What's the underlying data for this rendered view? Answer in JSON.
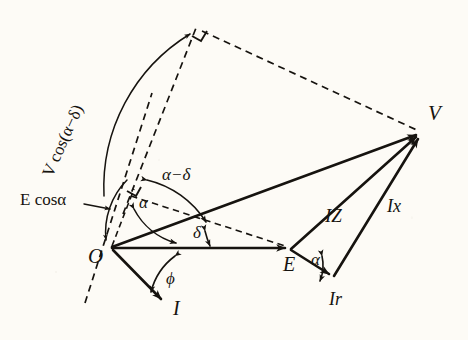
{
  "figure": {
    "kind": "phasor-diagram",
    "background_color": "#fdfbf6",
    "ink_color": "#16130f"
  },
  "labels": {
    "origin": "O",
    "voltage_v": "V",
    "emf_e": "E",
    "current_i": "I",
    "impedance_drop": "IZ",
    "reactive_drop": "Ix",
    "resistive_drop": "Ir",
    "angle_alpha_origin": "α",
    "angle_alpha_at_e": "α",
    "angle_delta": "δ",
    "angle_alpha_minus_delta": "α−δ",
    "angle_phi": "ϕ",
    "projection_e": "E cosα",
    "projection_v": "V cos(α−δ)"
  },
  "geometry": {
    "points": {
      "O": [
        110,
        248
      ],
      "V": [
        422,
        133
      ],
      "E": [
        290,
        248
      ],
      "I_tip": [
        166,
        302
      ],
      "Ir_tip": [
        333,
        277
      ],
      "apex": [
        196,
        28
      ],
      "foot_small": [
        133,
        190
      ]
    },
    "angles_deg": {
      "alpha": 44,
      "delta": 20,
      "alpha_minus_delta": 24,
      "phi": 26
    }
  }
}
